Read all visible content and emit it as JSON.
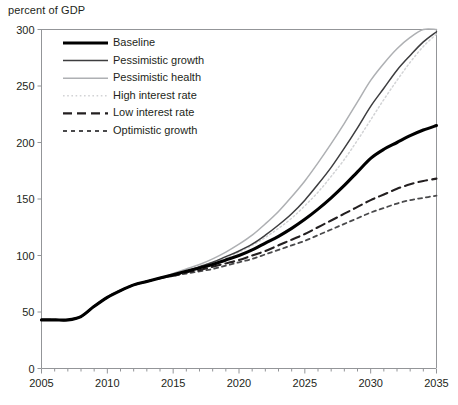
{
  "chart_data": {
    "type": "line",
    "title": "",
    "ylabel": "percent of GDP",
    "xlabel": "",
    "xlim": [
      2005,
      2035
    ],
    "ylim": [
      0,
      300
    ],
    "grid": false,
    "legend_position": "top-left",
    "xticks": [
      "2005",
      "2010",
      "2015",
      "2020",
      "2025",
      "2030",
      "2035"
    ],
    "xtick_values": [
      2005,
      2010,
      2015,
      2020,
      2025,
      2030,
      2035
    ],
    "minor_xtick_interval": 1,
    "yticks": [
      "0",
      "50",
      "100",
      "150",
      "200",
      "250",
      "300"
    ],
    "ytick_values": [
      0,
      50,
      100,
      150,
      200,
      250,
      300
    ],
    "x": [
      2005,
      2006,
      2007,
      2008,
      2009,
      2010,
      2011,
      2012,
      2013,
      2014,
      2015,
      2016,
      2017,
      2018,
      2019,
      2020,
      2021,
      2022,
      2023,
      2024,
      2025,
      2026,
      2027,
      2028,
      2029,
      2030,
      2031,
      2032,
      2033,
      2034,
      2035
    ],
    "series": [
      {
        "name": "Baseline",
        "color": "#000000",
        "width": 3.1,
        "dash": "none",
        "values": [
          43,
          43,
          43,
          46,
          55,
          63,
          69,
          74,
          77,
          80,
          83,
          86,
          89,
          92,
          96,
          100,
          105,
          111,
          117,
          124,
          132,
          141,
          151,
          162,
          174,
          186,
          194,
          200,
          206,
          211,
          215
        ]
      },
      {
        "name": "Pessimistic growth",
        "color": "#3d3d3f",
        "width": 1.5,
        "dash": "none",
        "values": [
          43,
          43,
          43,
          46,
          55,
          63,
          69,
          74,
          77,
          80,
          83,
          86,
          90,
          94,
          99,
          104,
          110,
          118,
          127,
          137,
          149,
          163,
          178,
          195,
          213,
          232,
          248,
          264,
          277,
          289,
          298
        ]
      },
      {
        "name": "Pessimistic health",
        "color": "#aeb0b3",
        "width": 1.5,
        "dash": "none",
        "values": [
          43,
          43,
          43,
          46,
          55,
          63,
          69,
          74,
          77,
          80,
          84,
          88,
          92,
          97,
          103,
          110,
          118,
          128,
          139,
          152,
          166,
          182,
          199,
          217,
          236,
          255,
          270,
          283,
          293,
          300,
          300
        ]
      },
      {
        "name": "High interest rate",
        "color": "#d2d3d5",
        "width": 1.5,
        "dash": "1.6,2.6",
        "values": [
          43,
          43,
          43,
          46,
          55,
          63,
          69,
          74,
          77,
          80,
          83,
          86,
          90,
          94,
          98,
          103,
          109,
          116,
          124,
          133,
          144,
          156,
          170,
          185,
          202,
          220,
          238,
          255,
          271,
          285,
          296
        ]
      },
      {
        "name": "Low interest rate",
        "color": "#231f20",
        "width": 2.1,
        "dash": "9,5",
        "values": [
          43,
          43,
          43,
          46,
          55,
          63,
          69,
          74,
          77,
          80,
          82,
          85,
          87,
          90,
          93,
          96,
          100,
          104,
          109,
          114,
          119,
          125,
          131,
          137,
          143,
          149,
          154,
          159,
          163,
          166,
          168
        ]
      },
      {
        "name": "Optimistic growth",
        "color": "#4a4a4c",
        "width": 1.8,
        "dash": "4,4",
        "values": [
          43,
          43,
          43,
          46,
          55,
          63,
          69,
          74,
          77,
          80,
          82,
          84,
          86,
          88,
          91,
          94,
          97,
          101,
          105,
          109,
          113,
          118,
          123,
          128,
          133,
          138,
          142,
          146,
          149,
          151,
          153
        ]
      }
    ]
  }
}
